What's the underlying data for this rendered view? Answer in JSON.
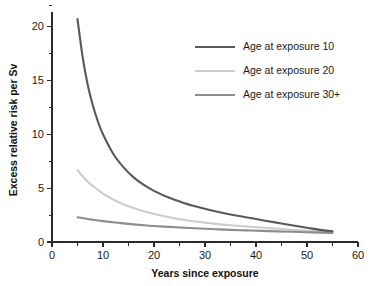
{
  "chart_data": {
    "type": "line",
    "title": "",
    "xlabel": "Years since exposure",
    "ylabel": "Excess relative risk per Sv",
    "xlim": [
      0,
      60
    ],
    "ylim": [
      0,
      22
    ],
    "grid": false,
    "legend_position": "top-right",
    "x_ticks_major": [
      0,
      10,
      20,
      30,
      40,
      50,
      60
    ],
    "x_ticks_minor": [
      5,
      15,
      25,
      35,
      45,
      55
    ],
    "y_ticks_major": [
      0,
      5,
      10,
      15,
      20
    ],
    "y_ticks_minor": [
      2.5,
      7.5,
      12.5,
      17.5
    ],
    "x": [
      5,
      6,
      7,
      8,
      9,
      10,
      12,
      14,
      16,
      18,
      20,
      23,
      26,
      29,
      32,
      35,
      38,
      41,
      44,
      47,
      50,
      53,
      55
    ],
    "series": [
      {
        "name": "Age at exposure 10",
        "color": "#5a5a5a",
        "values": [
          20.7,
          17.2,
          14.6,
          12.7,
          11.2,
          10.0,
          8.2,
          6.95,
          6.0,
          5.3,
          4.75,
          4.1,
          3.6,
          3.2,
          2.85,
          2.55,
          2.3,
          2.05,
          1.8,
          1.55,
          1.32,
          1.1,
          1.0
        ]
      },
      {
        "name": "Age at exposure 20",
        "color": "#cccccc",
        "values": [
          6.7,
          6.1,
          5.6,
          5.2,
          4.85,
          4.5,
          3.95,
          3.5,
          3.15,
          2.85,
          2.6,
          2.3,
          2.05,
          1.85,
          1.68,
          1.55,
          1.44,
          1.34,
          1.24,
          1.14,
          1.04,
          0.95,
          0.9
        ]
      },
      {
        "name": "Age at exposure 30+",
        "color": "#8d8d8d",
        "values": [
          2.3,
          2.22,
          2.14,
          2.07,
          2.0,
          1.94,
          1.83,
          1.73,
          1.64,
          1.56,
          1.49,
          1.4,
          1.32,
          1.25,
          1.19,
          1.13,
          1.08,
          1.03,
          0.99,
          0.95,
          0.91,
          0.87,
          0.85
        ]
      }
    ]
  },
  "legend": {
    "entries": [
      {
        "label": "Age at exposure 10",
        "color": "#5a5a5a"
      },
      {
        "label": "Age at exposure 20",
        "color": "#cccccc"
      },
      {
        "label": "Age at exposure 30+",
        "color": "#8d8d8d"
      }
    ]
  },
  "axis": {
    "x_title": "Years since exposure",
    "y_title": "Excess relative risk per Sv",
    "x_tick_labels": [
      "0",
      "10",
      "20",
      "30",
      "40",
      "50",
      "60"
    ],
    "y_tick_labels": [
      "0",
      "5",
      "10",
      "15",
      "20"
    ]
  },
  "colors": {
    "axis": "#2b2b2b",
    "text": "#1a1a1a",
    "background": "#ffffff"
  }
}
